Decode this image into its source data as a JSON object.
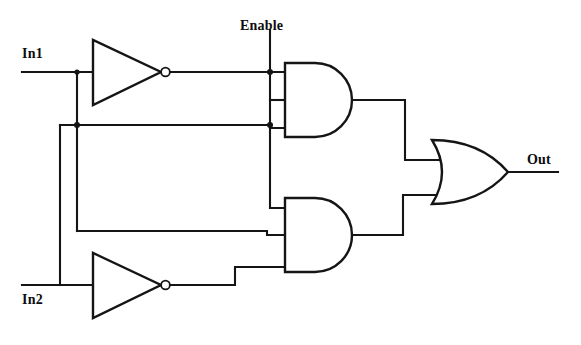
{
  "diagram": {
    "type": "digital-logic-circuit",
    "line_color": "#151515",
    "background_color": "#ffffff",
    "labels": {
      "in1": "In1",
      "in2": "In2",
      "enable": "Enable",
      "out": "Out"
    },
    "ports": [
      {
        "name": "In1",
        "kind": "input",
        "x": 22,
        "y": 72
      },
      {
        "name": "In2",
        "kind": "input",
        "x": 22,
        "y": 285
      },
      {
        "name": "Enable",
        "kind": "input",
        "x": 270,
        "y": 30
      },
      {
        "name": "Out",
        "kind": "output",
        "x": 560,
        "y": 172
      }
    ],
    "gates": [
      {
        "id": "inverter-top",
        "type": "NOT",
        "label": "inverter",
        "inputs": [
          "In1"
        ],
        "output": "nIn1",
        "x": 93,
        "y": 72
      },
      {
        "id": "inverter-bottom",
        "type": "NOT",
        "label": "inverter",
        "inputs": [
          "In2"
        ],
        "output": "nIn2",
        "x": 93,
        "y": 285
      },
      {
        "id": "and-top",
        "type": "AND",
        "label": "and-gate",
        "input_count": 3,
        "inputs": [
          "nIn1",
          "Enable",
          "In2"
        ],
        "output": "and1",
        "x": 310,
        "y": 100
      },
      {
        "id": "and-bottom",
        "type": "AND",
        "label": "and-gate",
        "input_count": 3,
        "inputs": [
          "Enable",
          "In1",
          "nIn2"
        ],
        "output": "and2",
        "x": 310,
        "y": 235
      },
      {
        "id": "or-out",
        "type": "OR",
        "label": "or-gate",
        "input_count": 2,
        "inputs": [
          "and1",
          "and2"
        ],
        "output": "Out",
        "x": 437,
        "y": 172
      }
    ],
    "junctions": [
      {
        "net": "In1",
        "x": 77,
        "y": 72
      },
      {
        "net": "In1",
        "x": 77,
        "y": 125
      },
      {
        "net": "Enable",
        "x": 270,
        "y": 72
      },
      {
        "net": "Enable",
        "x": 270,
        "y": 125
      }
    ]
  }
}
